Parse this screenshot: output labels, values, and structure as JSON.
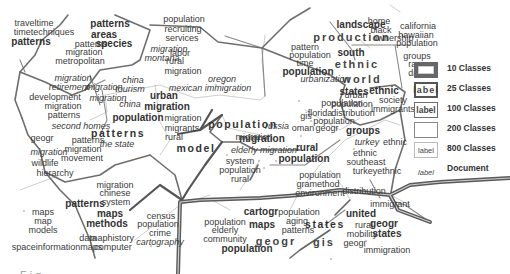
{
  "legend": {
    "items": [
      {
        "box_label": "",
        "text": "10 Classes"
      },
      {
        "box_label": "label",
        "text": "25 Classes"
      },
      {
        "box_label": "label",
        "text": "100 Classes"
      },
      {
        "box_label": "",
        "text": "200 Classes"
      },
      {
        "box_label": "label",
        "text": "800 Classes"
      },
      {
        "box_label": "label",
        "text": "Document"
      }
    ]
  },
  "labels": [
    {
      "t": "traveltime",
      "x": 34,
      "y": 23,
      "c": "s200"
    },
    {
      "t": "timetechniques",
      "x": 44,
      "y": 32,
      "c": "s200"
    },
    {
      "t": "patterns",
      "x": 31,
      "y": 42,
      "c": "s100"
    },
    {
      "t": "patterns",
      "x": 110,
      "y": 24,
      "c": "s100"
    },
    {
      "t": "areas",
      "x": 104,
      "y": 35,
      "c": "s100"
    },
    {
      "t": "patterns",
      "x": 91,
      "y": 44,
      "c": "s200"
    },
    {
      "t": "species",
      "x": 114,
      "y": 44,
      "c": "s100"
    },
    {
      "t": "migration",
      "x": 84,
      "y": 52,
      "c": "s200"
    },
    {
      "t": "metropolitan",
      "x": 80,
      "y": 61,
      "c": "s200"
    },
    {
      "t": "migration",
      "x": 169,
      "y": 49,
      "c": "s200 it"
    },
    {
      "t": "montana",
      "x": 162,
      "y": 58,
      "c": "s200 it"
    },
    {
      "t": "labor",
      "x": 180,
      "y": 53,
      "c": "s200"
    },
    {
      "t": "rural",
      "x": 175,
      "y": 61,
      "c": "s200"
    },
    {
      "t": "migration",
      "x": 183,
      "y": 71,
      "c": "s200"
    },
    {
      "t": "population",
      "x": 184,
      "y": 19,
      "c": "s200"
    },
    {
      "t": "recruiting",
      "x": 183,
      "y": 29,
      "c": "s200"
    },
    {
      "t": "services",
      "x": 182,
      "y": 38,
      "c": "s200"
    },
    {
      "t": "migration",
      "x": 73,
      "y": 78,
      "c": "s200 it"
    },
    {
      "t": "retirement",
      "x": 69,
      "y": 87,
      "c": "s200 it"
    },
    {
      "t": "migration",
      "x": 104,
      "y": 87,
      "c": "s200 it"
    },
    {
      "t": "development",
      "x": 55,
      "y": 97,
      "c": "s200"
    },
    {
      "t": "migration",
      "x": 108,
      "y": 98,
      "c": "s200 it"
    },
    {
      "t": "migration",
      "x": 63,
      "y": 106,
      "c": "s200"
    },
    {
      "t": "patterns",
      "x": 64,
      "y": 115,
      "c": "s200"
    },
    {
      "t": "china",
      "x": 133,
      "y": 80,
      "c": "s200 it"
    },
    {
      "t": "tourism",
      "x": 130,
      "y": 89,
      "c": "s200 it"
    },
    {
      "t": "china",
      "x": 130,
      "y": 104,
      "c": "s200 it"
    },
    {
      "t": "urban",
      "x": 164,
      "y": 96,
      "c": "s100"
    },
    {
      "t": "migration",
      "x": 167,
      "y": 107,
      "c": "s100"
    },
    {
      "t": "population",
      "x": 138,
      "y": 118,
      "c": "s100"
    },
    {
      "t": "migration",
      "x": 183,
      "y": 118,
      "c": "s200"
    },
    {
      "t": "migrants",
      "x": 182,
      "y": 128,
      "c": "s200"
    },
    {
      "t": "rural",
      "x": 174,
      "y": 137,
      "c": "s200"
    },
    {
      "t": "population",
      "x": 243,
      "y": 124,
      "c": "s25"
    },
    {
      "t": "oregon",
      "x": 222,
      "y": 79,
      "c": "s200 it"
    },
    {
      "t": "mexican immigration",
      "x": 210,
      "y": 88,
      "c": "s200 it"
    },
    {
      "t": "urbanization",
      "x": 325,
      "y": 79,
      "c": "s200 it"
    },
    {
      "t": "urban",
      "x": 356,
      "y": 95,
      "c": "s200"
    },
    {
      "t": "population",
      "x": 352,
      "y": 104,
      "c": "s200"
    },
    {
      "t": "distribution",
      "x": 353,
      "y": 113,
      "c": "s200"
    },
    {
      "t": "landscape",
      "x": 361,
      "y": 25,
      "c": "s100"
    },
    {
      "t": "production",
      "x": 352,
      "y": 37,
      "c": "s10"
    },
    {
      "t": "home",
      "x": 379,
      "y": 21,
      "c": "s200"
    },
    {
      "t": "black",
      "x": 381,
      "y": 30,
      "c": "s200"
    },
    {
      "t": "ownership",
      "x": 393,
      "y": 38,
      "c": "s200"
    },
    {
      "t": "pattern",
      "x": 305,
      "y": 47,
      "c": "s200"
    },
    {
      "t": "population",
      "x": 310,
      "y": 55,
      "c": "s200"
    },
    {
      "t": "south",
      "x": 351,
      "y": 53,
      "c": "s100"
    },
    {
      "t": "time",
      "x": 305,
      "y": 63,
      "c": "s200"
    },
    {
      "t": "ethnic",
      "x": 357,
      "y": 64,
      "c": "s10"
    },
    {
      "t": "world",
      "x": 362,
      "y": 79,
      "c": "s10"
    },
    {
      "t": "population",
      "x": 308,
      "y": 72,
      "c": "s100"
    },
    {
      "t": "california",
      "x": 418,
      "y": 26,
      "c": "s200"
    },
    {
      "t": "hawaiian",
      "x": 416,
      "y": 35,
      "c": "s200"
    },
    {
      "t": "population",
      "x": 417,
      "y": 43,
      "c": "s200"
    },
    {
      "t": "groups",
      "x": 417,
      "y": 56,
      "c": "s200"
    },
    {
      "t": "race",
      "x": 417,
      "y": 64,
      "c": "s200"
    },
    {
      "t": "data",
      "x": 417,
      "y": 73,
      "c": "s200"
    },
    {
      "t": "states",
      "x": 354,
      "y": 92,
      "c": "s100"
    },
    {
      "t": "ethnic",
      "x": 384,
      "y": 91,
      "c": "s100"
    },
    {
      "t": "society",
      "x": 393,
      "y": 100,
      "c": "s200"
    },
    {
      "t": "immigrants",
      "x": 393,
      "y": 109,
      "c": "s200"
    },
    {
      "t": "population",
      "x": 342,
      "y": 103,
      "c": "s200"
    },
    {
      "t": "florida",
      "x": 320,
      "y": 113,
      "c": "s200"
    },
    {
      "t": "gis",
      "x": 306,
      "y": 116,
      "c": "s200"
    },
    {
      "t": "population",
      "x": 334,
      "y": 121,
      "c": "s200"
    },
    {
      "t": "oman",
      "x": 303,
      "y": 128,
      "c": "s200"
    },
    {
      "t": "geogr",
      "x": 327,
      "y": 128,
      "c": "s200"
    },
    {
      "t": "groups",
      "x": 363,
      "y": 131,
      "c": "s100"
    },
    {
      "t": "russia",
      "x": 277,
      "y": 126,
      "c": "s200 it"
    },
    {
      "t": "migration",
      "x": 262,
      "y": 139,
      "c": "s100"
    },
    {
      "t": "migration",
      "x": 254,
      "y": 137,
      "c": "s200"
    },
    {
      "t": "rural",
      "x": 307,
      "y": 148,
      "c": "s100"
    },
    {
      "t": "population",
      "x": 304,
      "y": 159,
      "c": "s100"
    },
    {
      "t": "turkey",
      "x": 367,
      "y": 142,
      "c": "s200 it"
    },
    {
      "t": "ethnic",
      "x": 395,
      "y": 142,
      "c": "s200"
    },
    {
      "t": "ethnic",
      "x": 365,
      "y": 153,
      "c": "s200"
    },
    {
      "t": "southeast",
      "x": 366,
      "y": 162,
      "c": "s200"
    },
    {
      "t": "turkeyethnic",
      "x": 377,
      "y": 171,
      "c": "s200"
    },
    {
      "t": "population",
      "x": 320,
      "y": 175,
      "c": "s200"
    },
    {
      "t": "gramethod",
      "x": 318,
      "y": 184,
      "c": "s200"
    },
    {
      "t": "environment",
      "x": 320,
      "y": 193,
      "c": "s200"
    },
    {
      "t": "distribution",
      "x": 364,
      "y": 191,
      "c": "s200"
    },
    {
      "t": "immigrant",
      "x": 390,
      "y": 204,
      "c": "s200"
    },
    {
      "t": "elderly migration",
      "x": 264,
      "y": 150,
      "c": "s200 it"
    },
    {
      "t": "system",
      "x": 240,
      "y": 161,
      "c": "s200"
    },
    {
      "t": "population",
      "x": 240,
      "y": 170,
      "c": "s200"
    },
    {
      "t": "rural",
      "x": 240,
      "y": 179,
      "c": "s200"
    },
    {
      "t": "model",
      "x": 196,
      "y": 148,
      "c": "s25"
    },
    {
      "t": "patterns",
      "x": 118,
      "y": 133,
      "c": "s25"
    },
    {
      "t": "second homes",
      "x": 81,
      "y": 126,
      "c": "s200 it"
    },
    {
      "t": "geogr",
      "x": 42,
      "y": 138,
      "c": "s200"
    },
    {
      "t": "patterns",
      "x": 88,
      "y": 140,
      "c": "s200"
    },
    {
      "t": "the state",
      "x": 117,
      "y": 144,
      "c": "s200 it"
    },
    {
      "t": "migration",
      "x": 49,
      "y": 152,
      "c": "s200 it"
    },
    {
      "t": "migration",
      "x": 83,
      "y": 149,
      "c": "s200"
    },
    {
      "t": "movement",
      "x": 82,
      "y": 158,
      "c": "s200"
    },
    {
      "t": "wildlife",
      "x": 45,
      "y": 163,
      "c": "s200"
    },
    {
      "t": "hierarchy",
      "x": 55,
      "y": 173,
      "c": "s200"
    },
    {
      "t": "migration",
      "x": 115,
      "y": 185,
      "c": "s200"
    },
    {
      "t": "chinese",
      "x": 115,
      "y": 193,
      "c": "s200"
    },
    {
      "t": "system",
      "x": 116,
      "y": 202,
      "c": "s200"
    },
    {
      "t": "patterns",
      "x": 85,
      "y": 204,
      "c": "s100"
    },
    {
      "t": "maps",
      "x": 110,
      "y": 214,
      "c": "s100"
    },
    {
      "t": "methods",
      "x": 107,
      "y": 224,
      "c": "s100"
    },
    {
      "t": "maps",
      "x": 43,
      "y": 212,
      "c": "s200"
    },
    {
      "t": "map",
      "x": 43,
      "y": 221,
      "c": "s200"
    },
    {
      "t": "models",
      "x": 43,
      "y": 230,
      "c": "s200"
    },
    {
      "t": "data",
      "x": 88,
      "y": 238,
      "c": "s200"
    },
    {
      "t": "maphistory",
      "x": 112,
      "y": 238,
      "c": "s200"
    },
    {
      "t": "spaceinformationmaps",
      "x": 57,
      "y": 247,
      "c": "s200"
    },
    {
      "t": "computer",
      "x": 113,
      "y": 247,
      "c": "s200"
    },
    {
      "t": "census",
      "x": 161,
      "y": 216,
      "c": "s200"
    },
    {
      "t": "population",
      "x": 158,
      "y": 224,
      "c": "s200"
    },
    {
      "t": "crime",
      "x": 160,
      "y": 233,
      "c": "s200"
    },
    {
      "t": "cartography",
      "x": 160,
      "y": 242,
      "c": "s200 it"
    },
    {
      "t": "cartogr",
      "x": 261,
      "y": 212,
      "c": "s100"
    },
    {
      "t": "population",
      "x": 299,
      "y": 212,
      "c": "s200"
    },
    {
      "t": "aging",
      "x": 297,
      "y": 221,
      "c": "s200"
    },
    {
      "t": "patterns",
      "x": 298,
      "y": 230,
      "c": "s200"
    },
    {
      "t": "population",
      "x": 225,
      "y": 222,
      "c": "s200"
    },
    {
      "t": "elderly",
      "x": 225,
      "y": 230,
      "c": "s200"
    },
    {
      "t": "community",
      "x": 225,
      "y": 239,
      "c": "s200"
    },
    {
      "t": "population",
      "x": 247,
      "y": 249,
      "c": "s100"
    },
    {
      "t": "maps",
      "x": 262,
      "y": 225,
      "c": "s100"
    },
    {
      "t": "geogr",
      "x": 276,
      "y": 241,
      "c": "s10"
    },
    {
      "t": "gis",
      "x": 324,
      "y": 242,
      "c": "s10"
    },
    {
      "t": "states",
      "x": 325,
      "y": 224,
      "c": "s25"
    },
    {
      "t": "united",
      "x": 361,
      "y": 214,
      "c": "s100"
    },
    {
      "t": "rural",
      "x": 364,
      "y": 225,
      "c": "s200"
    },
    {
      "t": "geogr",
      "x": 384,
      "y": 224,
      "c": "s100"
    },
    {
      "t": "mobility",
      "x": 362,
      "y": 234,
      "c": "s200"
    },
    {
      "t": "states",
      "x": 387,
      "y": 234,
      "c": "s100"
    },
    {
      "t": "geogr",
      "x": 355,
      "y": 243,
      "c": "s200"
    },
    {
      "t": "immigration",
      "x": 387,
      "y": 250,
      "c": "s200"
    }
  ],
  "caption": "Fig. . . . . . . . . . . . . . . . . . . . . . . . . . . . . . . . . . . . . ."
}
